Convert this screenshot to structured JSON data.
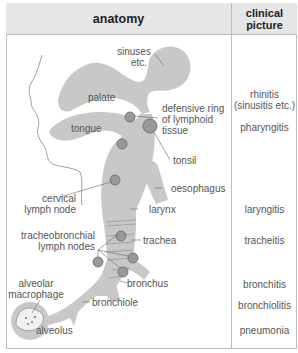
{
  "table": {
    "headers": {
      "anatomy": "anatomy",
      "clinical_line1": "clinical",
      "clinical_line2": "picture"
    }
  },
  "anatomy_labels": {
    "sinuses_1": "sinuses",
    "sinuses_2": "etc.",
    "palate": "palate",
    "tongue": "tongue",
    "defensive_ring_1": "defensive ring",
    "defensive_ring_2": "of lymphoid",
    "defensive_ring_3": "tissue",
    "tonsil": "tonsil",
    "oesophagus": "oesophagus",
    "cervical_1": "cervical",
    "cervical_2": "lymph node",
    "larynx": "larynx",
    "tracheobronchial_1": "tracheobronchial",
    "tracheobronchial_2": "lymph nodes",
    "trachea": "trachea",
    "alveolar_1": "alveolar",
    "alveolar_2": "macrophage",
    "bronchus": "bronchus",
    "bronchiole": "bronchiole",
    "alveolus": "alveolus"
  },
  "clinical_picture": {
    "rhinitis_1": "rhinitis",
    "rhinitis_2": "(sinusitis etc.)",
    "pharyngitis": "pharyngitis",
    "laryngitis": "laryngitis",
    "tracheitis": "tracheitis",
    "bronchitis": "bronchitis",
    "bronchiolitis": "bronchiolitis",
    "pneumonia": "pneumonia"
  },
  "colors": {
    "header_bg": "#e6e6e6",
    "tissue_fill": "#c8c8c8",
    "node_fill": "#999999",
    "border": "#bdbdbd"
  }
}
